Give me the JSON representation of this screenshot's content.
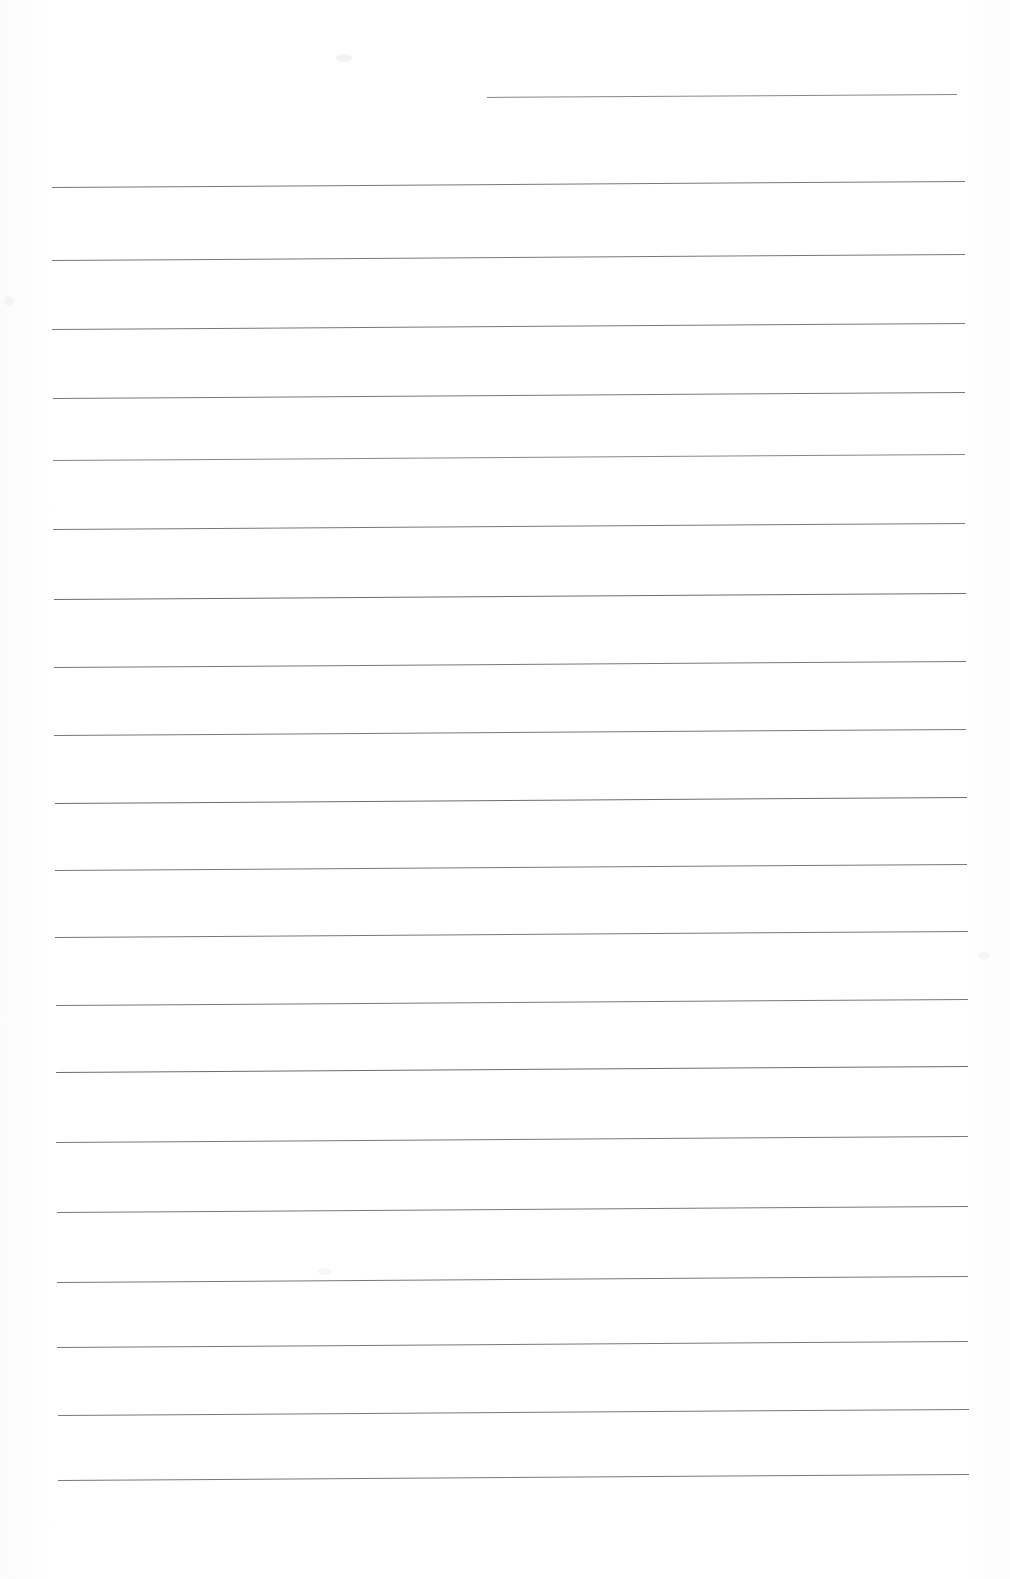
{
  "document": {
    "kind": "scanned-lined-paper",
    "page_width": 1010,
    "page_height": 1579,
    "background_color": "#fefefe",
    "rule_color": "#6e6e76",
    "caption": "",
    "visible_text": "",
    "text_content_note": "No text, headings, numbers or labels are present on the page — the scan shows only horizontal ruled lines."
  },
  "rules": {
    "count": 21,
    "full_width_count": 20,
    "partial_count": 1,
    "left_margin_x": 52,
    "right_margin_x": 967,
    "average_spacing": 68,
    "tilt_degrees": -0.38,
    "items": [
      {
        "index": 1,
        "x": 487,
        "y": 97,
        "width": 470,
        "weight": "thin"
      },
      {
        "index": 2,
        "x": 52,
        "y": 187,
        "width": 913,
        "weight": "mid"
      },
      {
        "index": 3,
        "x": 52,
        "y": 260,
        "width": 913,
        "weight": "mid"
      },
      {
        "index": 4,
        "x": 52,
        "y": 329,
        "width": 913,
        "weight": "mid"
      },
      {
        "index": 5,
        "x": 53,
        "y": 398,
        "width": 912,
        "weight": "mid"
      },
      {
        "index": 6,
        "x": 53,
        "y": 460,
        "width": 912,
        "weight": "thin"
      },
      {
        "index": 7,
        "x": 53,
        "y": 529,
        "width": 912,
        "weight": "mid"
      },
      {
        "index": 8,
        "x": 54,
        "y": 599,
        "width": 912,
        "weight": "dark"
      },
      {
        "index": 9,
        "x": 54,
        "y": 667,
        "width": 912,
        "weight": "mid"
      },
      {
        "index": 10,
        "x": 54,
        "y": 735,
        "width": 912,
        "weight": "mid"
      },
      {
        "index": 11,
        "x": 55,
        "y": 803,
        "width": 912,
        "weight": "dark"
      },
      {
        "index": 12,
        "x": 55,
        "y": 870,
        "width": 912,
        "weight": "mid"
      },
      {
        "index": 13,
        "x": 55,
        "y": 937,
        "width": 913,
        "weight": "mid"
      },
      {
        "index": 14,
        "x": 56,
        "y": 1005,
        "width": 912,
        "weight": "mid"
      },
      {
        "index": 15,
        "x": 56,
        "y": 1072,
        "width": 912,
        "weight": "dark"
      },
      {
        "index": 16,
        "x": 56,
        "y": 1142,
        "width": 912,
        "weight": "mid"
      },
      {
        "index": 17,
        "x": 57,
        "y": 1212,
        "width": 911,
        "weight": "mid"
      },
      {
        "index": 18,
        "x": 57,
        "y": 1282,
        "width": 911,
        "weight": "mid"
      },
      {
        "index": 19,
        "x": 57,
        "y": 1347,
        "width": 911,
        "weight": "mid"
      },
      {
        "index": 20,
        "x": 58,
        "y": 1415,
        "width": 911,
        "weight": "mid"
      },
      {
        "index": 21,
        "x": 58,
        "y": 1480,
        "width": 911,
        "weight": "mid"
      }
    ]
  },
  "artifacts": {
    "items": [
      {
        "name": "scan-smudge-top",
        "x": 336,
        "y": 54,
        "width": 16,
        "height": 8,
        "color": "#f2f2f2"
      },
      {
        "name": "scan-smudge-left",
        "x": 4,
        "y": 296,
        "width": 10,
        "height": 10,
        "color": "#f4f4f4"
      },
      {
        "name": "scan-smudge-right",
        "x": 978,
        "y": 952,
        "width": 12,
        "height": 7,
        "color": "#f5f5f5"
      },
      {
        "name": "scan-smudge-lower",
        "x": 318,
        "y": 1268,
        "width": 14,
        "height": 7,
        "color": "#f6f6f6"
      }
    ]
  }
}
